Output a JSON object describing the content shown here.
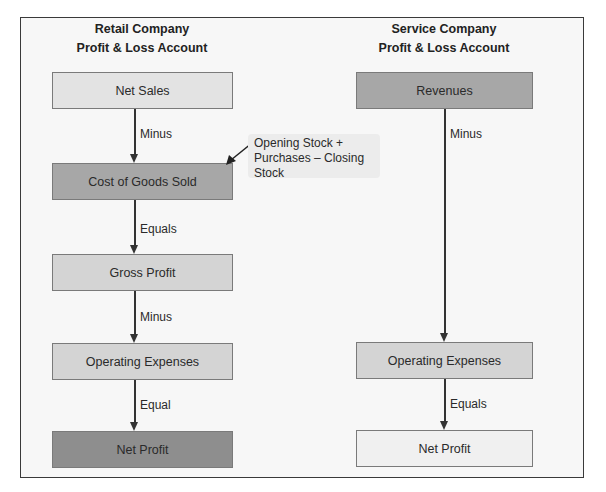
{
  "retail": {
    "title_line1": "Retail Company",
    "title_line2": "Profit & Loss Account",
    "boxes": [
      "Net Sales",
      "Cost of Goods Sold",
      "Gross Profit",
      "Operating Expenses",
      "Net Profit"
    ],
    "connectors": [
      "Minus",
      "Equals",
      "Minus",
      "Equal"
    ],
    "note": {
      "lines": [
        "Opening Stock +",
        "Purchases – Closing",
        "Stock"
      ]
    }
  },
  "service": {
    "title_line1": "Service Company",
    "title_line2": "Profit & Loss Account",
    "boxes": [
      "Revenues",
      "Operating Expenses",
      "Net Profit"
    ],
    "connectors": [
      "Minus",
      "Equals"
    ]
  },
  "colors": {
    "frame_border": "#3a3a3a",
    "frame_bg": "#f7f7f7",
    "box_light": "#d4d4d4",
    "box_mid": "#a7a7a7",
    "box_dark": "#8e8e8e",
    "box_white": "#f0f0f0",
    "arrow": "#333333"
  }
}
